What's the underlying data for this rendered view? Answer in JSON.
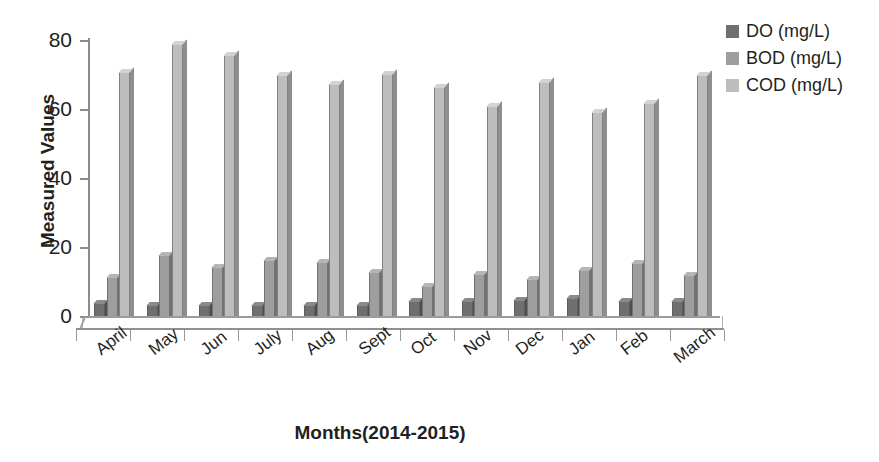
{
  "chart_data": {
    "type": "bar",
    "title": "",
    "xlabel": "Months(2014-2015)",
    "ylabel": "Measured Values",
    "categories": [
      "April",
      "May",
      "Jun",
      "July",
      "Aug",
      "Sept",
      "Oct",
      "Nov",
      "Dec",
      "Jan",
      "Feb",
      "March"
    ],
    "series": [
      {
        "name": "DO (mg/L)",
        "color": "#6f6f6f",
        "values": [
          5.5,
          5.0,
          5.0,
          5.0,
          5.0,
          5.0,
          6.0,
          6.0,
          6.5,
          7.0,
          6.0,
          6.0
        ]
      },
      {
        "name": "BOD (mg/L)",
        "color": "#9e9e9e",
        "values": [
          13.0,
          19.5,
          16.0,
          18.0,
          17.5,
          14.5,
          10.5,
          14.0,
          12.5,
          15.0,
          17.0,
          13.5
        ]
      },
      {
        "name": "COD (mg/L)",
        "color": "#bdbdbd",
        "values": [
          72.5,
          80.5,
          77.5,
          71.5,
          69.0,
          72.0,
          68.0,
          62.5,
          69.5,
          61.0,
          63.5,
          71.5
        ]
      }
    ],
    "yticks": [
      0,
      20,
      40,
      60,
      80
    ],
    "ylim": [
      0,
      86
    ],
    "grid": false,
    "legend_position": "right",
    "style": "3d-clustered-column"
  },
  "axes": {
    "y_title": "Measured Values",
    "x_title": "Months(2014-2015)",
    "y_tick_labels": [
      "0",
      "20",
      "40",
      "60",
      "80"
    ]
  },
  "legend": {
    "items": [
      {
        "label": "DO (mg/L)",
        "swatch": "#6f6f6f"
      },
      {
        "label": "BOD (mg/L)",
        "swatch": "#9e9e9e"
      },
      {
        "label": "COD (mg/L)",
        "swatch": "#bdbdbd"
      }
    ]
  }
}
